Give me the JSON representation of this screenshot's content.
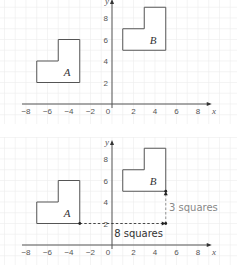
{
  "diagrams": [
    {
      "name": "original",
      "x_range": [
        -8,
        9
      ],
      "y_range": [
        0,
        9.5
      ],
      "x_ticks": [
        "-8",
        "-6",
        "-4",
        "-2",
        "0",
        "2",
        "4",
        "6",
        "8"
      ],
      "y_ticks": [
        "2",
        "4",
        "6",
        "8"
      ],
      "x_axis_label": "x",
      "y_axis_label": "y",
      "shapes": [
        {
          "label": "A",
          "points": [
            [
              -7,
              2
            ],
            [
              -3,
              2
            ],
            [
              -3,
              6
            ],
            [
              -5,
              6
            ],
            [
              -5,
              4
            ],
            [
              -7,
              4
            ]
          ],
          "label_pos": [
            -4,
            3
          ]
        },
        {
          "label": "B",
          "points": [
            [
              1,
              5
            ],
            [
              5,
              5
            ],
            [
              5,
              9
            ],
            [
              3,
              9
            ],
            [
              3,
              7
            ],
            [
              1,
              7
            ]
          ],
          "label_pos": [
            4,
            6
          ]
        }
      ]
    },
    {
      "name": "translation",
      "x_range": [
        -8,
        9
      ],
      "y_range": [
        0,
        9.5
      ],
      "x_ticks": [
        "-8",
        "-6",
        "-4",
        "-2",
        "0",
        "2",
        "4",
        "6",
        "8"
      ],
      "y_ticks": [
        "2",
        "4",
        "6",
        "8"
      ],
      "x_axis_label": "x",
      "y_axis_label": "y",
      "shapes": [
        {
          "label": "A",
          "points": [
            [
              -7,
              2
            ],
            [
              -3,
              2
            ],
            [
              -3,
              6
            ],
            [
              -5,
              6
            ],
            [
              -5,
              4
            ],
            [
              -7,
              4
            ]
          ],
          "label_pos": [
            -4,
            3
          ]
        },
        {
          "label": "B",
          "points": [
            [
              1,
              5
            ],
            [
              5,
              5
            ],
            [
              5,
              9
            ],
            [
              3,
              9
            ],
            [
              3,
              7
            ],
            [
              1,
              7
            ]
          ],
          "label_pos": [
            4,
            6
          ]
        }
      ],
      "annotations": [
        {
          "text": "8 squares",
          "from": [
            -3,
            2
          ],
          "to": [
            5,
            2
          ],
          "color": "#333333"
        },
        {
          "text": "3 squares",
          "from": [
            5,
            2
          ],
          "to": [
            5,
            5
          ],
          "color": "#888888"
        }
      ]
    }
  ]
}
